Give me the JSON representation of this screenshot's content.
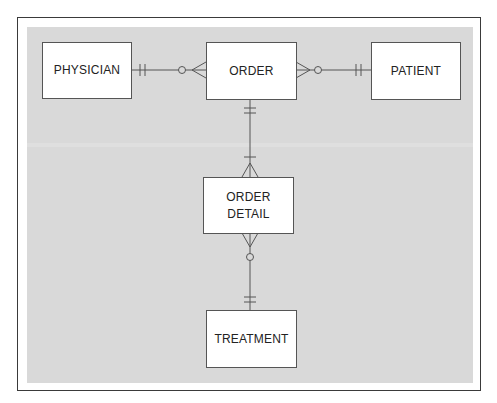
{
  "diagram": {
    "type": "entity-relationship",
    "notation": "crow's foot",
    "colors": {
      "background": "#d9d9d9",
      "frame": "#3a3a3a",
      "entity_fill": "#ffffff",
      "line": "#555555"
    },
    "entities": {
      "physician": {
        "label": "PHYSICIAN"
      },
      "order": {
        "label": "ORDER"
      },
      "patient": {
        "label": "PATIENT"
      },
      "order_detail": {
        "label_line1": "ORDER",
        "label_line2": "DETAIL"
      },
      "treatment": {
        "label": "TREATMENT"
      }
    },
    "relationships": [
      {
        "from": "PHYSICIAN",
        "from_cardinality": "one and only one",
        "to": "ORDER",
        "to_cardinality": "zero or many"
      },
      {
        "from": "PATIENT",
        "from_cardinality": "one and only one",
        "to": "ORDER",
        "to_cardinality": "zero or many"
      },
      {
        "from": "ORDER",
        "from_cardinality": "one and only one",
        "to": "ORDER DETAIL",
        "to_cardinality": "one or many"
      },
      {
        "from": "TREATMENT",
        "from_cardinality": "one and only one",
        "to": "ORDER DETAIL",
        "to_cardinality": "zero or many"
      }
    ]
  }
}
